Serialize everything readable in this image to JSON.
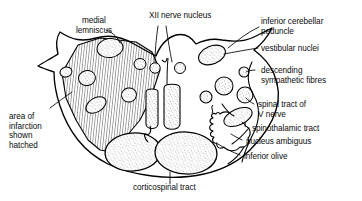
{
  "figure": {
    "stroke_color": "#000000",
    "background_color": "#ffffff",
    "stipple_color": "#6b6b6b",
    "hatch_color": "#000000"
  },
  "labels": {
    "medial_lemniscus": "medial\nlemniscus",
    "xii_nerve_nucleus": "XII nerve nucleus",
    "inferior_cerebellar_peduncle": "inferior cerebellar\npeduncle",
    "vestibular_nuclei": "vestibular nuclei",
    "descending_sympathetic_fibres": "descending\nsympathetic fibres",
    "spinal_tract_of_v_nerve": "spinal tract of\nV nerve",
    "spinothalamic_tract": "spinothalamic tract",
    "nucleus_ambiguus": "nucleus ambiguus",
    "inferior_olive": "inferior olive",
    "corticospinal_tract": "corticospinal tract",
    "area_of_infarction": "area of\ninfarction\nshown\nhatched"
  }
}
